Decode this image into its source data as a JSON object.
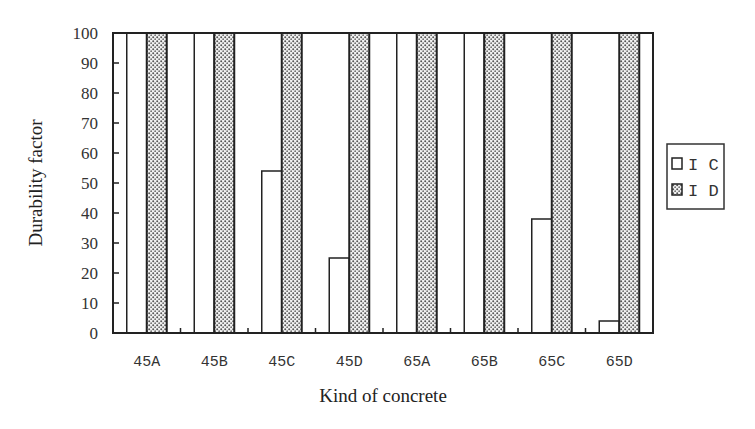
{
  "chart_data": {
    "type": "bar",
    "title": "",
    "xlabel": "Kind of concrete",
    "ylabel": "Durability factor",
    "categories": [
      "45A",
      "45B",
      "45C",
      "45D",
      "65A",
      "65B",
      "65C",
      "65D"
    ],
    "series": [
      {
        "name": "IC",
        "fill": "white",
        "values": [
          100,
          100,
          54,
          25,
          100,
          100,
          38,
          4
        ]
      },
      {
        "name": "ID",
        "fill": "dotted",
        "values": [
          100,
          100,
          100,
          100,
          100,
          100,
          100,
          100
        ]
      }
    ],
    "ylim": [
      0,
      100
    ],
    "yticks": [
      0,
      10,
      20,
      30,
      40,
      50,
      60,
      70,
      80,
      90,
      100
    ],
    "grid": false,
    "legend_position": "right"
  },
  "legend": {
    "items": [
      {
        "label": "I C",
        "series": "IC"
      },
      {
        "label": "I D",
        "series": "ID"
      }
    ]
  },
  "colors": {
    "stroke": "#222222",
    "dot": "#555555",
    "background": "#ffffff"
  }
}
